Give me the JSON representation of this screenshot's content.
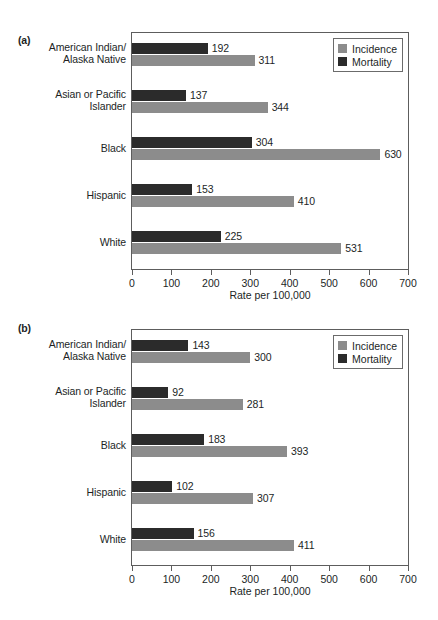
{
  "figure": {
    "axis_title": "Rate per 100,000",
    "legend": [
      {
        "key": "incidence",
        "label": "Incidence",
        "color": "#8c8c8c"
      },
      {
        "key": "mortality",
        "label": "Mortality",
        "color": "#2b2b2b"
      }
    ],
    "tick_labels": [
      "0",
      "100",
      "200",
      "300",
      "400",
      "500",
      "600",
      "700"
    ]
  },
  "panels": [
    {
      "id": "a",
      "label": "(a)",
      "categories": [
        "American Indian/\nAlaska Native",
        "Asian or Pacific\nIslander",
        "Black",
        "Hispanic",
        "White"
      ],
      "mortality": [
        "192",
        "137",
        "304",
        "153",
        "225"
      ],
      "incidence": [
        "311",
        "344",
        "630",
        "410",
        "531"
      ]
    },
    {
      "id": "b",
      "label": "(b)",
      "categories": [
        "American Indian/\nAlaska Native",
        "Asian or Pacific\nIslander",
        "Black",
        "Hispanic",
        "White"
      ],
      "mortality": [
        "143",
        "92",
        "183",
        "102",
        "156"
      ],
      "incidence": [
        "300",
        "281",
        "393",
        "307",
        "411"
      ]
    }
  ],
  "chart_data": [
    {
      "type": "bar",
      "orientation": "horizontal",
      "panel": "(a)",
      "title": "",
      "xlabel": "Rate per 100,000",
      "ylabel": "",
      "xlim": [
        0,
        700
      ],
      "xticks": [
        0,
        100,
        200,
        300,
        400,
        500,
        600,
        700
      ],
      "grid": false,
      "legend_position": "top-right inside axes",
      "categories": [
        "American Indian/Alaska Native",
        "Asian or Pacific Islander",
        "Black",
        "Hispanic",
        "White"
      ],
      "series": [
        {
          "name": "Mortality",
          "color": "#2b2b2b",
          "values": [
            192,
            137,
            304,
            153,
            225
          ]
        },
        {
          "name": "Incidence",
          "color": "#8c8c8c",
          "values": [
            311,
            344,
            630,
            410,
            531
          ]
        }
      ]
    },
    {
      "type": "bar",
      "orientation": "horizontal",
      "panel": "(b)",
      "title": "",
      "xlabel": "Rate per 100,000",
      "ylabel": "",
      "xlim": [
        0,
        700
      ],
      "xticks": [
        0,
        100,
        200,
        300,
        400,
        500,
        600,
        700
      ],
      "grid": false,
      "legend_position": "top-right inside axes",
      "categories": [
        "American Indian/Alaska Native",
        "Asian or Pacific Islander",
        "Black",
        "Hispanic",
        "White"
      ],
      "series": [
        {
          "name": "Mortality",
          "color": "#2b2b2b",
          "values": [
            143,
            92,
            183,
            102,
            156
          ]
        },
        {
          "name": "Incidence",
          "color": "#8c8c8c",
          "values": [
            300,
            281,
            393,
            307,
            411
          ]
        }
      ]
    }
  ]
}
